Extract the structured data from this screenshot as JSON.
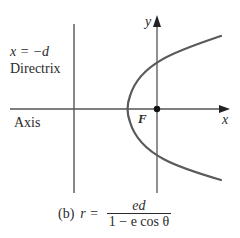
{
  "figure": {
    "directrix_equation": "x = −d",
    "directrix_label": "Directrix",
    "axis_label": "Axis",
    "focus_label": "F",
    "x_axis_label": "x",
    "y_axis_label": "y",
    "caption": {
      "part_label": "(b)",
      "lhs": "r =",
      "numerator": "ed",
      "denominator": "1 − e cos θ"
    }
  },
  "colors": {
    "line": "#555555",
    "curve": "#5a5a5a",
    "text": "#2b2b2b"
  },
  "geometry": {
    "directrix_x": 73,
    "y_axis_x": 157,
    "x_axis_y": 109,
    "vertex_x": 129,
    "focus": [
      157,
      109
    ],
    "curve_top_end": [
      221,
      36
    ],
    "curve_bottom_end": [
      221,
      178
    ]
  }
}
